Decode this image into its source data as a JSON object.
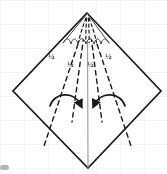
{
  "figure": {
    "background": "#ffffff",
    "grid_color": "#f4f4f4",
    "ink_color": "#1a1a1a",
    "crease_color": "#8a8a8a"
  },
  "shape": {
    "name": "diamond-outline",
    "vertices": {
      "top": [
        87,
        13
      ],
      "right": [
        161,
        91
      ],
      "bottom": [
        88,
        168
      ],
      "left": [
        13,
        91
      ]
    },
    "stroke_width": 1.6
  },
  "center_crease": {
    "name": "vertical-center-crease",
    "from": [
      87,
      13
    ],
    "to": [
      88,
      168
    ],
    "style": "solid-light"
  },
  "fold_lines": [
    {
      "name": "fold-line-outer-left",
      "from": [
        87,
        18
      ],
      "to": [
        44,
        145
      ],
      "style": "dashed"
    },
    {
      "name": "fold-line-inner-left",
      "from": [
        87,
        18
      ],
      "to": [
        73,
        120
      ],
      "style": "dashed"
    },
    {
      "name": "fold-line-inner-right",
      "from": [
        88,
        18
      ],
      "to": [
        101,
        120
      ],
      "style": "dashed"
    },
    {
      "name": "fold-line-outer-right",
      "from": [
        88,
        18
      ],
      "to": [
        131,
        145
      ],
      "style": "dashed"
    }
  ],
  "labels": [
    {
      "id": "quarter-left-outer",
      "text": "¼",
      "x": 50,
      "y": 54
    },
    {
      "id": "quarter-left-inner",
      "text": "¼",
      "x": 69,
      "y": 62
    },
    {
      "id": "quarter-right-inner",
      "text": "¼",
      "x": 88,
      "y": 62
    },
    {
      "id": "quarter-right-outer",
      "text": "¼",
      "x": 107,
      "y": 54
    }
  ],
  "arrows": [
    {
      "id": "fold-arrow-left",
      "direction": "left-to-center",
      "path": "M 50,105 C 55,92 74,92 81,107",
      "head": [
        81,
        108
      ]
    },
    {
      "id": "fold-arrow-right",
      "direction": "right-to-center",
      "path": "M 125,105 C 120,92 101,92 94,107",
      "head": [
        94,
        108
      ]
    }
  ],
  "fan_detail": {
    "name": "scalloped-fan",
    "apex": [
      87,
      14
    ],
    "outline": "M 87,14 L 64,42 C 67,36 70,37 71,43 C 72,37 76,36 78,43 C 80,36 84,36 86,43 C 88,36 92,36 94,43 C 96,36 100,37 101,43 C 102,37 105,36 108,42 Z",
    "inner_creases": [
      "M 87,17 C 83,26 80,33 78,42",
      "M 87,17 C 86,27 86,34 86,42",
      "M 87,17 C 88,27 88,34 88,42",
      "M 87,17 C 91,26 94,33 96,42"
    ]
  },
  "smudge": {
    "name": "corner-smudge",
    "x": 0,
    "y": 165,
    "width": 9,
    "height": 5,
    "color": "#9a9a9a"
  }
}
